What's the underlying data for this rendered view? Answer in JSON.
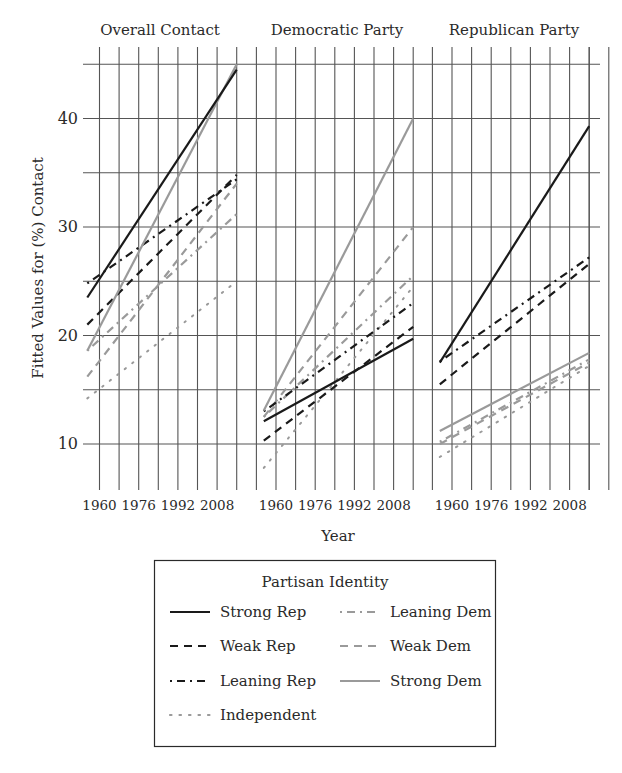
{
  "chart_data": {
    "type": "line",
    "ylabel": "Fitted Values for (%) Contact",
    "xlabel": "Year",
    "ylim": [
      6,
      46.5
    ],
    "xlim": [
      1955,
      2016
    ],
    "x_ticks": [
      1960,
      1976,
      1992,
      2008
    ],
    "y_ticks": [
      10,
      20,
      30,
      40
    ],
    "grid": true,
    "legend": {
      "title": "Partisan Identity",
      "placement": "bottom-center",
      "entries": [
        {
          "key": "strong_rep",
          "label": "Strong Rep"
        },
        {
          "key": "weak_rep",
          "label": "Weak Rep"
        },
        {
          "key": "leaning_rep",
          "label": "Leaning Rep"
        },
        {
          "key": "independent",
          "label": "Independent"
        },
        {
          "key": "leaning_dem",
          "label": "Leaning Dem"
        },
        {
          "key": "weak_dem",
          "label": "Weak Dem"
        },
        {
          "key": "strong_dem",
          "label": "Strong Dem"
        }
      ]
    },
    "styles": {
      "strong_rep": {
        "color": "#1a1a1a",
        "dash": "solid"
      },
      "weak_rep": {
        "color": "#1a1a1a",
        "dash": "dash"
      },
      "leaning_rep": {
        "color": "#1a1a1a",
        "dash": "dashdot"
      },
      "independent": {
        "color": "#9a9a9a",
        "dash": "dot"
      },
      "leaning_dem": {
        "color": "#9a9a9a",
        "dash": "dashdot"
      },
      "weak_dem": {
        "color": "#9a9a9a",
        "dash": "dash"
      },
      "strong_dem": {
        "color": "#9a9a9a",
        "dash": "solid"
      }
    },
    "panels": [
      {
        "title": "Overall Contact",
        "series": [
          {
            "key": "strong_rep",
            "x": [
              1955,
              2016
            ],
            "y": [
              23.5,
              44.5
            ]
          },
          {
            "key": "weak_rep",
            "x": [
              1955,
              2016
            ],
            "y": [
              21.0,
              34.8
            ]
          },
          {
            "key": "leaning_rep",
            "x": [
              1955,
              2016
            ],
            "y": [
              24.8,
              34.4
            ]
          },
          {
            "key": "independent",
            "x": [
              1955,
              2016
            ],
            "y": [
              14.2,
              25.0
            ]
          },
          {
            "key": "leaning_dem",
            "x": [
              1955,
              2016
            ],
            "y": [
              18.6,
              31.2
            ]
          },
          {
            "key": "weak_dem",
            "x": [
              1955,
              2016
            ],
            "y": [
              16.2,
              34.0
            ]
          },
          {
            "key": "strong_dem",
            "x": [
              1955,
              2016
            ],
            "y": [
              18.6,
              45.0
            ]
          }
        ]
      },
      {
        "title": "Democratic Party",
        "series": [
          {
            "key": "strong_rep",
            "x": [
              1955,
              2016
            ],
            "y": [
              12.1,
              19.7
            ]
          },
          {
            "key": "weak_rep",
            "x": [
              1955,
              2016
            ],
            "y": [
              10.3,
              20.8
            ]
          },
          {
            "key": "leaning_rep",
            "x": [
              1955,
              2016
            ],
            "y": [
              13.0,
              23.0
            ]
          },
          {
            "key": "independent",
            "x": [
              1955,
              2016
            ],
            "y": [
              7.8,
              24.5
            ]
          },
          {
            "key": "leaning_dem",
            "x": [
              1955,
              2016
            ],
            "y": [
              12.5,
              25.5
            ]
          },
          {
            "key": "weak_dem",
            "x": [
              1955,
              2016
            ],
            "y": [
              12.5,
              30.0
            ]
          },
          {
            "key": "strong_dem",
            "x": [
              1955,
              2016
            ],
            "y": [
              13.1,
              40.0
            ]
          }
        ]
      },
      {
        "title": "Republican Party",
        "series": [
          {
            "key": "strong_rep",
            "x": [
              1955,
              2016
            ],
            "y": [
              17.5,
              39.3
            ]
          },
          {
            "key": "weak_rep",
            "x": [
              1955,
              2016
            ],
            "y": [
              15.5,
              26.6
            ]
          },
          {
            "key": "leaning_rep",
            "x": [
              1955,
              2016
            ],
            "y": [
              17.6,
              27.2
            ]
          },
          {
            "key": "independent",
            "x": [
              1955,
              2016
            ],
            "y": [
              8.8,
              17.2
            ]
          },
          {
            "key": "leaning_dem",
            "x": [
              1955,
              2016
            ],
            "y": [
              10.2,
              17.8
            ]
          },
          {
            "key": "weak_dem",
            "x": [
              1955,
              2016
            ],
            "y": [
              10.0,
              17.5
            ]
          },
          {
            "key": "strong_dem",
            "x": [
              1955,
              2016
            ],
            "y": [
              11.2,
              18.4
            ]
          }
        ]
      }
    ]
  }
}
